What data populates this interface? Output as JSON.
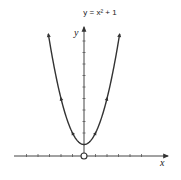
{
  "chart_data": {
    "type": "line",
    "title": "y = x² + 1",
    "xlabel": "x",
    "ylabel": "y",
    "function": "x^2 + 1",
    "xlim": [
      -6,
      7
    ],
    "ylim": [
      0,
      11
    ],
    "x_ticks": [
      -5,
      -4,
      -3,
      -2,
      -1,
      1,
      2,
      3,
      4,
      5
    ],
    "y_ticks": [
      1,
      2,
      3,
      4,
      5,
      6,
      7,
      8,
      9,
      10
    ],
    "grid": false,
    "legend": null,
    "series": [
      {
        "name": "y = x² + 1",
        "x": [
          -3.1,
          -3,
          -2.5,
          -2,
          -1.5,
          -1,
          -0.5,
          0,
          0.5,
          1,
          1.5,
          2,
          2.5,
          3,
          3.1
        ],
        "values": [
          10.61,
          10,
          7.25,
          5,
          3.25,
          2,
          1.25,
          1,
          1.25,
          2,
          3.25,
          5,
          7.25,
          10,
          10.61
        ]
      }
    ],
    "annotations": [
      "origin marked with open circle",
      "arrowheads on curve and axes"
    ],
    "colors": {
      "curve": "#333333",
      "axes": "#444444"
    }
  }
}
